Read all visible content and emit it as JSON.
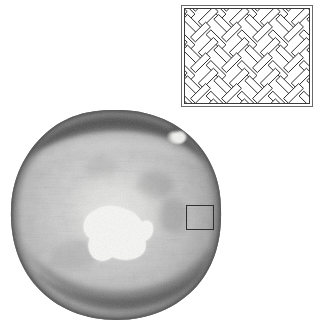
{
  "figure": {
    "type": "scientific-micrograph-with-schematic-inset",
    "background_color": "#ffffff",
    "width": 315,
    "height": 325
  },
  "specimen": {
    "label": "circular-specimen-micrograph",
    "shape": "irregular-disc",
    "modality": "grayscale",
    "center": {
      "x": 114,
      "y": 215
    },
    "radius_x": 106,
    "radius_y": 105,
    "bounds": {
      "left": 8,
      "top": 110,
      "right": 222,
      "bottom": 322
    },
    "base_tone": "#b9b9b9",
    "rim_tone": "#6f6f6f",
    "highlight_tone": "#efefef",
    "dark_ring_tone": "#555555",
    "texture": "fine radial speckle grain",
    "features": [
      {
        "name": "bright-central-patch",
        "description": "irregular amoeboid bright inclusion near center",
        "center": {
          "x": 112,
          "y": 212
        },
        "width": 58,
        "height": 48,
        "tone": "#f4f4f2"
      },
      {
        "name": "small-bright-spot",
        "description": "small bright blob upper right quadrant",
        "center": {
          "x": 179,
          "y": 139
        },
        "width": 13,
        "height": 9,
        "tone": "#f2f2f0"
      },
      {
        "name": "upper-dark-ring-band",
        "description": "dark concentric arc band near top margin",
        "tone": "#4a4a4a"
      },
      {
        "name": "lower-dark-ring-band",
        "description": "dark concentric arc band near bottom margin",
        "tone": "#585858"
      }
    ]
  },
  "roi": {
    "name": "region-of-interest-box",
    "shape": "rectangle",
    "stroke_color": "#2f2f2f",
    "stroke_width": 1,
    "x": 186,
    "y": 205,
    "width": 28,
    "height": 25
  },
  "inset": {
    "name": "weave-pattern-schematic",
    "description": "line drawing of herringbone / basketweave arrangement of elongated bars",
    "x": 181,
    "y": 5,
    "width": 132,
    "height": 102,
    "outer_border_color": "#6a6a6a",
    "inner_border_color": "#3a3a3a",
    "background_color": "#ffffff",
    "line_color": "#1a1a1a",
    "bar_fill": "#ffffff",
    "bar_length": 22,
    "bar_thickness": 7,
    "orientations_deg": [
      45,
      -45
    ]
  }
}
